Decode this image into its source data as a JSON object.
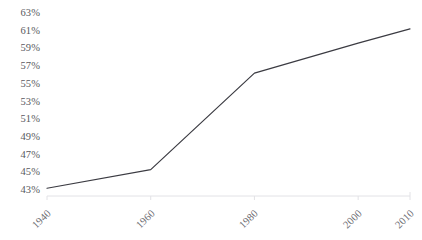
{
  "chart_data": {
    "type": "line",
    "title": "",
    "xlabel": "",
    "ylabel": "",
    "x": [
      1940,
      1960,
      1980,
      2000,
      2010
    ],
    "series": [
      {
        "name": "series-1",
        "values": [
          43.2,
          45.3,
          56.2,
          59.6,
          61.2
        ]
      }
    ],
    "points": [
      {
        "x": 1940,
        "y": 43.2
      },
      {
        "x": 1960,
        "y": 45.3
      },
      {
        "x": 1980,
        "y": 56.2
      },
      {
        "x": 2000,
        "y": 59.6
      },
      {
        "x": 2010,
        "y": 61.2
      }
    ],
    "xlim": [
      1940,
      2010
    ],
    "ylim": [
      43,
      63
    ],
    "y_tick_labels": [
      "63%",
      "61%",
      "59%",
      "57%",
      "55%",
      "53%",
      "51%",
      "49%",
      "47%",
      "45%",
      "43%"
    ],
    "y_tick_values": [
      63,
      61,
      59,
      57,
      55,
      53,
      51,
      49,
      47,
      45,
      43
    ],
    "x_tick_labels": [
      "1940",
      "1960",
      "1980",
      "2000",
      "2010"
    ],
    "x_tick_values": [
      1940,
      1960,
      1980,
      2000,
      2010
    ],
    "grid": false,
    "legend": "none",
    "line_color": "#3b3b42",
    "axis_color": "#e2e2e6",
    "tick_label_color": "#59595e",
    "background_color": "#ffffff"
  }
}
